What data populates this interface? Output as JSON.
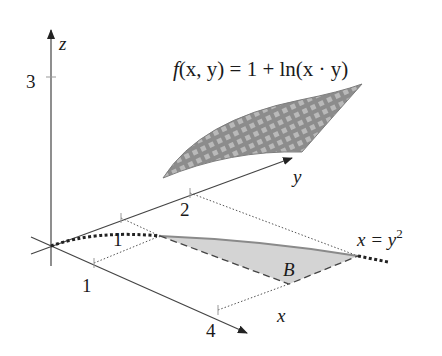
{
  "figure": {
    "type": "3d-surface-over-region",
    "function_label": "f(x, y) = 1 + ln(x · y)",
    "function_parts": {
      "f": "f",
      "args": "(x, y) = 1 + ln(x · y)"
    },
    "curve_label": "x = y",
    "curve_label_exp": "2",
    "region_label": "B",
    "axes": {
      "x": {
        "label": "x",
        "ticks": [
          "1",
          "4"
        ]
      },
      "y": {
        "label": "y",
        "ticks": [
          "1",
          "2"
        ]
      },
      "z": {
        "label": "z",
        "ticks": [
          "3"
        ]
      }
    },
    "region": {
      "description": "Region B bounded by x = y^2, x = 4 and y = 1",
      "vertices": [
        [
          1,
          1
        ],
        [
          4,
          2
        ],
        [
          4,
          1
        ]
      ]
    },
    "colors": {
      "axis": "#444444",
      "surface": "#8a8a8a",
      "region_fill": "#d4d4d4",
      "curve": "#222222"
    }
  }
}
